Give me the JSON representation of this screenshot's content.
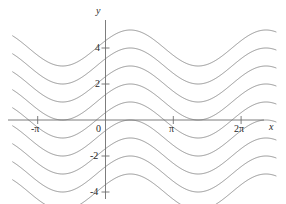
{
  "figure": {
    "width": 286,
    "height": 204,
    "background_color": "#ffffff",
    "curve_color": "#8a8a8a",
    "axis_color": "#6e6e6e",
    "text_color": "#2a2a2a"
  },
  "axes": {
    "x_axis_label": "x",
    "y_axis_label": "y",
    "x_ticks": [
      {
        "label": "-π",
        "value": -3.14159
      },
      {
        "label": "0",
        "value": 0
      },
      {
        "label": "π",
        "value": 3.14159
      },
      {
        "label": "2π",
        "value": 6.28319
      }
    ],
    "y_ticks": [
      {
        "label": "4",
        "value": 4
      },
      {
        "label": "2",
        "value": 2
      },
      {
        "label": "0",
        "value": 0
      },
      {
        "label": "-2",
        "value": -2
      },
      {
        "label": "-4",
        "value": -4
      }
    ]
  },
  "chart_data": {
    "type": "line",
    "title": "",
    "xlabel": "x",
    "ylabel": "y",
    "xlim": [
      -4.3,
      7.9
    ],
    "ylim": [
      -5.3,
      5.1
    ],
    "grid": false,
    "legend": "none",
    "formula": "y = sin(x + 0.42) + C",
    "amplitude": 1,
    "period": 6.28319,
    "phase": 0.42,
    "series": [
      {
        "name": "C = 4",
        "offset": 4
      },
      {
        "name": "C = 3",
        "offset": 3
      },
      {
        "name": "C = 2",
        "offset": 2
      },
      {
        "name": "C = 1",
        "offset": 1
      },
      {
        "name": "C = 0",
        "offset": 0
      },
      {
        "name": "C = -1",
        "offset": -1
      },
      {
        "name": "C = -2",
        "offset": -2
      },
      {
        "name": "C = -3",
        "offset": -3
      },
      {
        "name": "C = -4",
        "offset": -4
      }
    ],
    "x_tick_values": [
      -3.14159,
      0,
      3.14159,
      6.28319
    ],
    "x_tick_labels": [
      "-π",
      "0",
      "π",
      "2π"
    ],
    "y_tick_values": [
      4,
      2,
      0,
      -2,
      -4
    ],
    "y_tick_labels": [
      "4",
      "2",
      "0",
      "-2",
      "-4"
    ]
  }
}
